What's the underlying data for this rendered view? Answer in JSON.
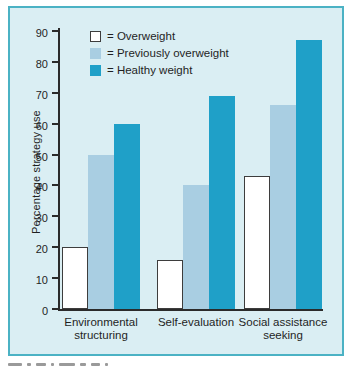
{
  "chart_data": {
    "type": "bar",
    "title": "",
    "xlabel": "",
    "ylabel": "Percentage strategy use",
    "ylim": [
      0,
      90
    ],
    "yticks": [
      0,
      10,
      20,
      30,
      40,
      50,
      60,
      70,
      80,
      90
    ],
    "grid": false,
    "legend_position": "top-left-inside",
    "legend_prefix": "= ",
    "categories": [
      "Environmental structuring",
      "Self-evaluation",
      "Social assistance seeking"
    ],
    "series": [
      {
        "name": "Overweight",
        "color": "#ffffff",
        "outline": "#3d3d3d",
        "values": [
          20,
          16,
          43
        ]
      },
      {
        "name": "Previously overweight",
        "color": "#a9cee2",
        "outline": "",
        "values": [
          50,
          40,
          66
        ]
      },
      {
        "name": "Healthy weight",
        "color": "#1fa0c8",
        "outline": "",
        "values": [
          60,
          69,
          87
        ]
      }
    ]
  },
  "colors": {
    "panel_background": "#daeef3",
    "panel_border": "#4bb2c4",
    "axis": "#2b2b2b",
    "text": "#1f1f1f"
  },
  "clipped_caption_marks": [
    14,
    4,
    10,
    3,
    16,
    6,
    9,
    3
  ]
}
